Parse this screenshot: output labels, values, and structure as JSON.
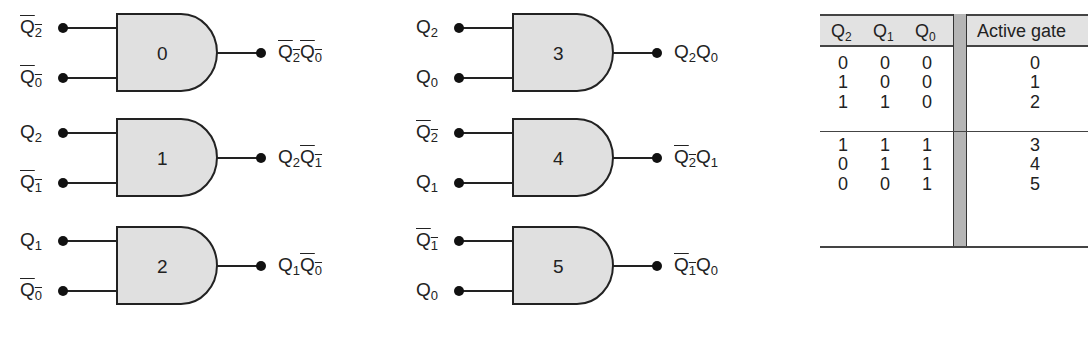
{
  "diagram": {
    "type": "and-gate-decoder",
    "gates": [
      {
        "id": "0",
        "in1": {
          "name": "Q",
          "sub": "2",
          "bar": true
        },
        "in2": {
          "name": "Q",
          "sub": "0",
          "bar": true
        },
        "out": [
          {
            "name": "Q",
            "sub": "2",
            "bar": true
          },
          {
            "name": "Q",
            "sub": "0",
            "bar": true
          }
        ]
      },
      {
        "id": "1",
        "in1": {
          "name": "Q",
          "sub": "2",
          "bar": false
        },
        "in2": {
          "name": "Q",
          "sub": "1",
          "bar": true
        },
        "out": [
          {
            "name": "Q",
            "sub": "2",
            "bar": false
          },
          {
            "name": "Q",
            "sub": "1",
            "bar": true
          }
        ]
      },
      {
        "id": "2",
        "in1": {
          "name": "Q",
          "sub": "1",
          "bar": false
        },
        "in2": {
          "name": "Q",
          "sub": "0",
          "bar": true
        },
        "out": [
          {
            "name": "Q",
            "sub": "1",
            "bar": false
          },
          {
            "name": "Q",
            "sub": "0",
            "bar": true
          }
        ]
      },
      {
        "id": "3",
        "in1": {
          "name": "Q",
          "sub": "2",
          "bar": false
        },
        "in2": {
          "name": "Q",
          "sub": "0",
          "bar": false
        },
        "out": [
          {
            "name": "Q",
            "sub": "2",
            "bar": false
          },
          {
            "name": "Q",
            "sub": "0",
            "bar": false
          }
        ]
      },
      {
        "id": "4",
        "in1": {
          "name": "Q",
          "sub": "2",
          "bar": true
        },
        "in2": {
          "name": "Q",
          "sub": "1",
          "bar": false
        },
        "out": [
          {
            "name": "Q",
            "sub": "2",
            "bar": true
          },
          {
            "name": "Q",
            "sub": "1",
            "bar": false
          }
        ]
      },
      {
        "id": "5",
        "in1": {
          "name": "Q",
          "sub": "1",
          "bar": true
        },
        "in2": {
          "name": "Q",
          "sub": "0",
          "bar": false
        },
        "out": [
          {
            "name": "Q",
            "sub": "1",
            "bar": true
          },
          {
            "name": "Q",
            "sub": "0",
            "bar": false
          }
        ]
      }
    ],
    "colors": {
      "gate_fill": "#e0e0e0",
      "stroke": "#222222",
      "table_header": "#e2e2e2",
      "table_bar": "#b5b5b5"
    }
  },
  "table": {
    "headers": [
      {
        "name": "Q",
        "sub": "2"
      },
      {
        "name": "Q",
        "sub": "1"
      },
      {
        "name": "Q",
        "sub": "0"
      },
      {
        "label": "Active gate"
      }
    ],
    "rows": [
      {
        "q2": "0",
        "q1": "0",
        "q0": "0",
        "gate": "0"
      },
      {
        "q2": "1",
        "q1": "0",
        "q0": "0",
        "gate": "1"
      },
      {
        "q2": "1",
        "q1": "1",
        "q0": "0",
        "gate": "2"
      },
      {
        "q2": "1",
        "q1": "1",
        "q0": "1",
        "gate": "3"
      },
      {
        "q2": "0",
        "q1": "1",
        "q0": "1",
        "gate": "4"
      },
      {
        "q2": "0",
        "q1": "0",
        "q0": "1",
        "gate": "5"
      }
    ]
  }
}
